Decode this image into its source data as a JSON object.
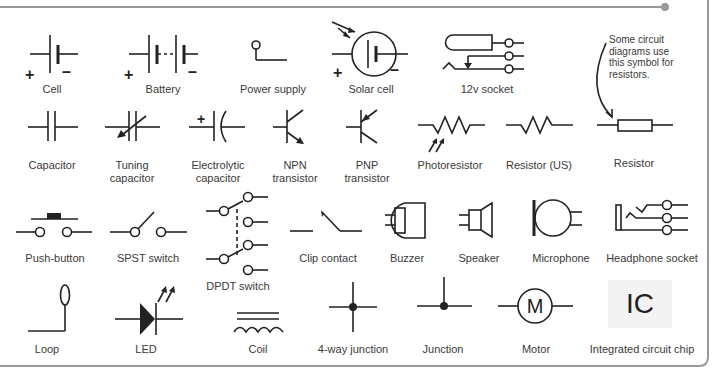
{
  "diagram": {
    "note": "Some circuit diagrams use this symbol for resistors.",
    "rows": [
      [
        {
          "id": "cell",
          "label": "Cell"
        },
        {
          "id": "battery",
          "label": "Battery"
        },
        {
          "id": "power_supply",
          "label": "Power supply"
        },
        {
          "id": "solar_cell",
          "label": "Solar cell"
        },
        {
          "id": "socket_12v",
          "label": "12v socket"
        }
      ],
      [
        {
          "id": "capacitor",
          "label": "Capacitor"
        },
        {
          "id": "tuning_capacitor",
          "label": "Tuning capacitor"
        },
        {
          "id": "electrolytic_capacitor",
          "label": "Electrolytic capacitor"
        },
        {
          "id": "npn_transistor",
          "label": "NPN transistor"
        },
        {
          "id": "pnp_transistor",
          "label": "PNP transistor"
        },
        {
          "id": "photoresistor",
          "label": "Photoresistor"
        },
        {
          "id": "resistor_us",
          "label": "Resistor (US)"
        },
        {
          "id": "resistor",
          "label": "Resistor"
        }
      ],
      [
        {
          "id": "push_button",
          "label": "Push-button"
        },
        {
          "id": "spst_switch",
          "label": "SPST switch"
        },
        {
          "id": "dpdt_switch",
          "label": "DPDT switch"
        },
        {
          "id": "clip_contact",
          "label": "Clip contact"
        },
        {
          "id": "buzzer",
          "label": "Buzzer"
        },
        {
          "id": "speaker",
          "label": "Speaker"
        },
        {
          "id": "microphone",
          "label": "Microphone"
        },
        {
          "id": "headphone_socket",
          "label": "Headphone socket"
        }
      ],
      [
        {
          "id": "loop",
          "label": "Loop"
        },
        {
          "id": "led",
          "label": "LED"
        },
        {
          "id": "coil",
          "label": "Coil"
        },
        {
          "id": "junction_4way",
          "label": "4-way junction"
        },
        {
          "id": "junction",
          "label": "Junction"
        },
        {
          "id": "motor",
          "label": "Motor"
        },
        {
          "id": "ic_chip",
          "label": "Integrated circuit chip"
        }
      ]
    ],
    "labels": {
      "cell_l1": "Cell",
      "battery_l1": "Battery",
      "power_l1": "Power supply",
      "solar_l1": "Solar cell",
      "socket_l1": "12v socket",
      "cap_l1": "Capacitor",
      "tune_l1": "Tuning",
      "tune_l2": "capacitor",
      "elec_l1": "Electrolytic",
      "elec_l2": "capacitor",
      "npn_l1": "NPN",
      "npn_l2": "transistor",
      "pnp_l1": "PNP",
      "pnp_l2": "transistor",
      "photo_l1": "Photoresistor",
      "rus_l1": "Resistor (US)",
      "res_l1": "Resistor",
      "push_l1": "Push-button",
      "spst_l1": "SPST switch",
      "dpdt_l1": "DPDT switch",
      "clip_l1": "Clip contact",
      "buzz_l1": "Buzzer",
      "spk_l1": "Speaker",
      "mic_l1": "Microphone",
      "hp_l1": "Headphone socket",
      "loop_l1": "Loop",
      "led_l1": "LED",
      "coil_l1": "Coil",
      "j4_l1": "4-way junction",
      "j_l1": "Junction",
      "motor_l1": "Motor",
      "ic_l1": "Integrated circuit chip"
    },
    "glyphs": {
      "plus": "+",
      "minus": "–",
      "motor_letter": "M",
      "ic_text": "IC"
    },
    "colors": {
      "stroke": "#222222",
      "frame": "#999999",
      "text": "#3a3a3a",
      "ic_bg": "#f3f3f3"
    }
  }
}
